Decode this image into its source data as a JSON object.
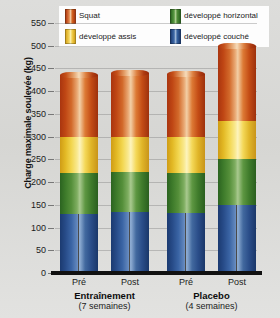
{
  "chart_data": {
    "type": "bar",
    "subtype": "stacked-column",
    "title": "",
    "xlabel": "",
    "ylabel": "Charge maximale soulevée (kg)",
    "ylim": [
      0,
      550
    ],
    "ytick_step": 50,
    "yticks": [
      0,
      50,
      100,
      150,
      200,
      250,
      300,
      350,
      400,
      450,
      500,
      550
    ],
    "grid": true,
    "legend_position": "top",
    "categories": [
      "Pré",
      "Post",
      "Pré",
      "Post"
    ],
    "groups": [
      {
        "name": "Entraînement",
        "sub": "(7 semaines)",
        "categories": [
          "Pré",
          "Post"
        ]
      },
      {
        "name": "Placebo",
        "sub": "(4 semaines)",
        "categories": [
          "Pré",
          "Post"
        ]
      }
    ],
    "series": [
      {
        "name": "développé couché",
        "key": "couche",
        "color": "#2a4d89",
        "values": [
          130,
          135,
          133,
          150
        ]
      },
      {
        "name": "développé horizontal",
        "key": "horiz",
        "color": "#3f7b2b",
        "values": [
          90,
          88,
          88,
          100
        ]
      },
      {
        "name": "développé assis",
        "key": "assis",
        "color": "#e2b824",
        "values": [
          80,
          77,
          79,
          85
        ]
      },
      {
        "name": "Squat",
        "key": "squat",
        "color": "#c44c15",
        "values": [
          135,
          140,
          137,
          165
        ]
      }
    ],
    "totals": [
      435,
      440,
      437,
      500
    ],
    "legend": [
      {
        "label": "Squat",
        "key": "squat",
        "color": "#c44c15"
      },
      {
        "label": "développé horizontal",
        "key": "horiz",
        "color": "#3f7b2b"
      },
      {
        "label": "développé assis",
        "key": "assis",
        "color": "#e2b824"
      },
      {
        "label": "développé couché",
        "key": "couche",
        "color": "#2a4d89"
      }
    ]
  }
}
